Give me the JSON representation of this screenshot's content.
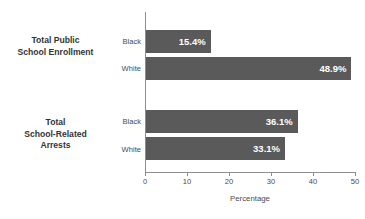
{
  "chart_data": {
    "type": "bar",
    "orientation": "horizontal",
    "title": "Public School Enrollment and Arrests",
    "xlabel": "Percentage",
    "ylabel": "",
    "xlim": [
      0,
      50
    ],
    "xticks": [
      0,
      10,
      20,
      30,
      40,
      50
    ],
    "xtick_labels": [
      "0",
      "10",
      "20",
      "30",
      "40",
      "50"
    ],
    "grid": false,
    "legend": "none",
    "bar_color": "#5a5a5a",
    "value_label_color": "#ffffff",
    "groups": [
      {
        "label": "Total Public\nSchool Enrollment",
        "label_lines": [
          "Total Public",
          "School Enrollment"
        ],
        "bars": [
          {
            "category": "Black",
            "value": 15.4,
            "value_label": "15.4%"
          },
          {
            "category": "White",
            "value": 48.9,
            "value_label": "48.9%"
          }
        ]
      },
      {
        "label": "Total\nSchool-Related\nArrests",
        "label_lines": [
          "Total",
          "School-Related",
          "Arrests"
        ],
        "bars": [
          {
            "category": "Black",
            "value": 36.1,
            "value_label": "36.1%"
          },
          {
            "category": "White",
            "value": 33.1,
            "value_label": "33.1%"
          }
        ]
      }
    ],
    "categories": [
      "Black",
      "White",
      "Black",
      "White"
    ],
    "values": [
      15.4,
      48.9,
      36.1,
      33.1
    ]
  }
}
